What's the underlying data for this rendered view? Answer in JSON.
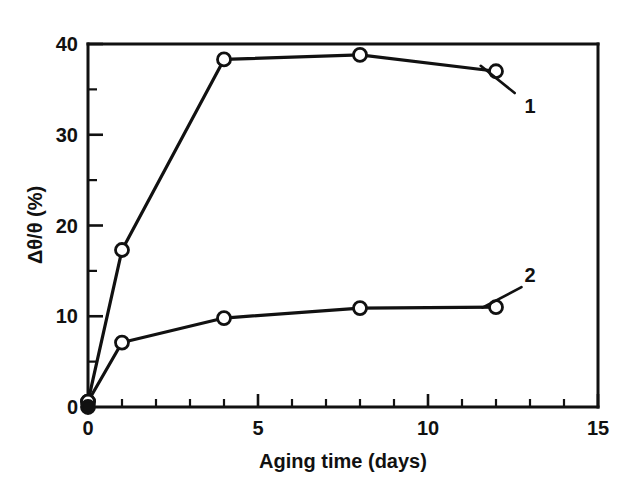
{
  "chart_data": {
    "type": "line",
    "title": "",
    "xlabel": "Aging time (days)",
    "ylabel": "Δθ/θ (%)",
    "xlim": [
      0,
      15
    ],
    "ylim": [
      0,
      40
    ],
    "grid": false,
    "legend_position": "inline-annotation",
    "x_ticks_major": [
      0,
      5,
      10,
      15
    ],
    "x_tick_labels": [
      "0",
      "5",
      "10",
      "15"
    ],
    "x_ticks_minor": [
      1,
      2,
      3,
      4,
      6,
      7,
      8,
      9,
      11,
      12,
      13,
      14
    ],
    "y_ticks_major": [
      0,
      10,
      20,
      30,
      40
    ],
    "y_tick_labels": [
      "0",
      "10",
      "20",
      "30",
      "40"
    ],
    "y_ticks_minor": [
      5,
      15,
      25,
      35
    ],
    "series": [
      {
        "name": "1",
        "label": "1",
        "marker": "open-circle",
        "x": [
          0,
          1,
          4,
          8,
          12
        ],
        "values": [
          0.6,
          17.3,
          38.3,
          38.8,
          37.0
        ]
      },
      {
        "name": "2",
        "label": "2",
        "marker": "open-circle",
        "x": [
          0,
          1,
          4,
          8,
          12
        ],
        "values": [
          0.6,
          7.1,
          9.8,
          10.9,
          11.0
        ]
      }
    ],
    "origin_marker": {
      "name": "origin-filled-dot",
      "x": 0,
      "y": 0,
      "marker": "filled-circle"
    },
    "annotations": [
      {
        "name": "series-1-callout",
        "text": "1",
        "text_x": 13.0,
        "text_y": 33.2,
        "leader_from_x": 12.55,
        "leader_from_y": 34.6,
        "leader_to_x": 11.55,
        "leader_to_y": 37.6
      },
      {
        "name": "series-2-callout",
        "text": "2",
        "text_x": 13.0,
        "text_y": 14.6,
        "leader_from_x": 12.75,
        "leader_from_y": 13.2,
        "leader_to_x": 11.6,
        "leader_to_y": 10.95
      }
    ],
    "colors": {
      "line": "#111111",
      "marker_fill": "#ffffff",
      "axis": "#111111",
      "background": "#ffffff"
    }
  }
}
